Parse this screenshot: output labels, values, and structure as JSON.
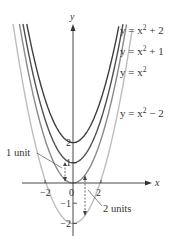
{
  "diagram": {
    "axes": {
      "x_label": "x",
      "y_label": "y",
      "x_ticks": [
        {
          "value": -2,
          "label": "−2"
        },
        {
          "value": 0,
          "label": "0"
        },
        {
          "value": 2,
          "label": "2"
        }
      ],
      "y_ticks": [
        {
          "value": 2,
          "label": "2"
        },
        {
          "value": 1,
          "label": "1"
        },
        {
          "value": -1,
          "label": "−1"
        },
        {
          "value": -2,
          "label": "−2"
        }
      ]
    },
    "curves": [
      {
        "label_prefix": "y = x",
        "label_exp": "2",
        "label_suffix": " + 2",
        "shift": 2,
        "color": "#3f3f3f"
      },
      {
        "label_prefix": "y = x",
        "label_exp": "2",
        "label_suffix": " + 1",
        "shift": 1,
        "color": "#505050"
      },
      {
        "label_prefix": "y = x",
        "label_exp": "2",
        "label_suffix": "",
        "shift": 0,
        "color": "#8a8a8a"
      },
      {
        "label_prefix": "y = x",
        "label_exp": "2",
        "label_suffix": " − 2",
        "shift": -2,
        "color": "#bdbdbd"
      }
    ],
    "annotations": {
      "one_unit": "1 unit",
      "two_units": "2 units"
    }
  }
}
